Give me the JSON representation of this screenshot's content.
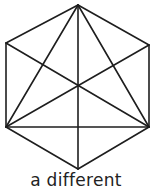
{
  "caption": "a different",
  "style": {
    "stroke": "#1e1e1e",
    "background": "#ffffff"
  },
  "diagram": {
    "shape": "hexagon with diagonals",
    "vertices": {
      "top": [
        78,
        5
      ],
      "upper_right": [
        149,
        45
      ],
      "lower_right": [
        149,
        127
      ],
      "bottom": [
        78,
        169
      ],
      "lower_left": [
        6,
        127
      ],
      "upper_left": [
        6,
        43
      ]
    },
    "edges": [
      [
        "top",
        "upper_right"
      ],
      [
        "upper_right",
        "lower_right"
      ],
      [
        "lower_right",
        "bottom"
      ],
      [
        "bottom",
        "lower_left"
      ],
      [
        "lower_left",
        "upper_left"
      ],
      [
        "upper_left",
        "top"
      ],
      [
        "top",
        "bottom"
      ],
      [
        "top",
        "lower_left"
      ],
      [
        "top",
        "lower_right"
      ],
      [
        "upper_left",
        "lower_right"
      ],
      [
        "upper_right",
        "lower_left"
      ],
      [
        "lower_left",
        "lower_right"
      ]
    ]
  }
}
